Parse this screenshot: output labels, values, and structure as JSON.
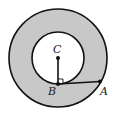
{
  "diagram": {
    "type": "concentric-circles",
    "colors": {
      "annulus_fill": "#c8c8c8",
      "inner_fill": "#ffffff",
      "stroke": "#111111"
    },
    "points": {
      "C": {
        "label": "C",
        "role": "center"
      },
      "B": {
        "label": "B",
        "role": "tangent point on inner circle"
      },
      "A": {
        "label": "A",
        "role": "point on outer circle"
      }
    },
    "segments": [
      "CB",
      "BA"
    ],
    "annotations": [
      "right angle at B"
    ]
  }
}
